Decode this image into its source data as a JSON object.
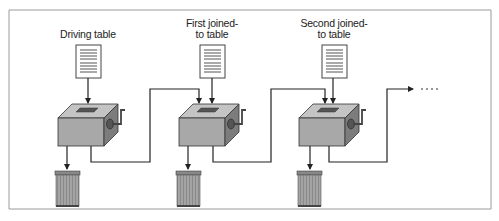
{
  "diagram": {
    "labels": {
      "driving": "Driving table",
      "first_line1": "First joined-",
      "first_line2": "to table",
      "second_line1": "Second joined-",
      "second_line2": "to table"
    },
    "continuation": "....",
    "stages": [
      {
        "name": "driving-table",
        "label": "Driving table"
      },
      {
        "name": "first-joined-to-table",
        "label": "First joined-to table"
      },
      {
        "name": "second-joined-to-table",
        "label": "Second joined-to table"
      }
    ],
    "colors": {
      "border": "#9a9a9a",
      "line": "#222222",
      "box_front": "#a8a8a8",
      "box_top": "#c4c4c4",
      "box_side": "#7a7a7a",
      "can": "#9c9c9c",
      "dots": "#999999"
    }
  }
}
